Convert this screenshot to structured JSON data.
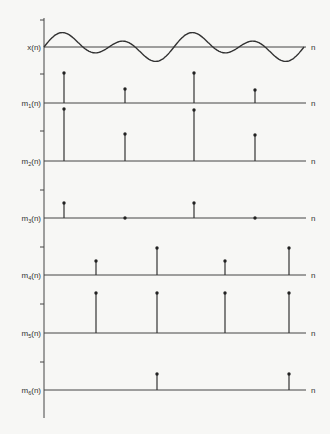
{
  "figure": {
    "axis_end_label": "n",
    "vertical_axis_x": 44,
    "axis_end_x": 306,
    "ink_color": "#333333",
    "background": "#f7f7f5"
  },
  "panels": [
    {
      "label": "x(n)",
      "base": "x",
      "subscript": "",
      "baseline_y": 47,
      "type": "wave"
    },
    {
      "label": "m1(n)",
      "base": "m",
      "subscript": "1",
      "baseline_y": 103,
      "type": "stem",
      "stems": [
        {
          "x": 64,
          "h": 30
        },
        {
          "x": 125,
          "h": 14
        },
        {
          "x": 194,
          "h": 30
        },
        {
          "x": 255,
          "h": 13
        }
      ]
    },
    {
      "label": "m2(n)",
      "base": "m",
      "subscript": "2",
      "baseline_y": 161,
      "type": "stem",
      "stems": [
        {
          "x": 64,
          "h": 52
        },
        {
          "x": 125,
          "h": 27
        },
        {
          "x": 194,
          "h": 51
        },
        {
          "x": 255,
          "h": 26
        }
      ]
    },
    {
      "label": "m3(n)",
      "base": "m",
      "subscript": "3",
      "baseline_y": 218,
      "type": "stem",
      "stems": [
        {
          "x": 64,
          "h": 15
        },
        {
          "x": 125,
          "h": 0
        },
        {
          "x": 194,
          "h": 15
        },
        {
          "x": 255,
          "h": 0
        }
      ]
    },
    {
      "label": "m4(n)",
      "base": "m",
      "subscript": "4",
      "baseline_y": 275,
      "type": "stem",
      "stems": [
        {
          "x": 96,
          "h": 14
        },
        {
          "x": 157,
          "h": 27
        },
        {
          "x": 225,
          "h": 14
        },
        {
          "x": 289,
          "h": 27
        }
      ]
    },
    {
      "label": "m5(n)",
      "base": "m",
      "subscript": "5",
      "baseline_y": 333,
      "type": "stem",
      "stems": [
        {
          "x": 96,
          "h": 40
        },
        {
          "x": 157,
          "h": 40
        },
        {
          "x": 225,
          "h": 40
        },
        {
          "x": 289,
          "h": 40
        }
      ]
    },
    {
      "label": "m6(n)",
      "base": "m",
      "subscript": "6",
      "baseline_y": 390,
      "type": "stem",
      "stems": [
        {
          "x": 157,
          "h": 16
        },
        {
          "x": 289,
          "h": 16
        }
      ]
    }
  ],
  "ticks_y": [
    20,
    74,
    131,
    190,
    247,
    304,
    362
  ]
}
